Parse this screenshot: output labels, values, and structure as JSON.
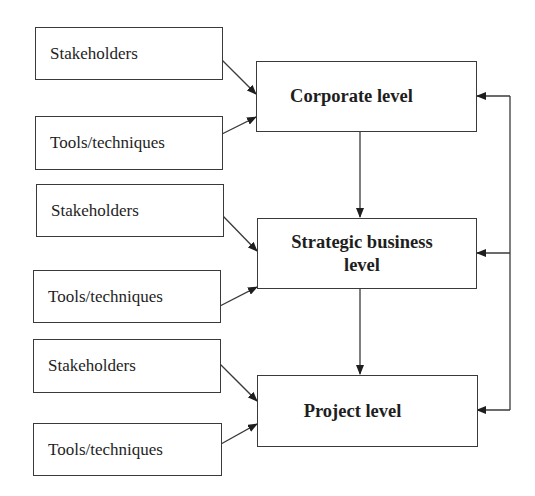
{
  "diagram": {
    "levels": [
      {
        "id": "corporate",
        "label": "Corporate level",
        "inputs": [
          {
            "id": "stakeholders-1",
            "label": "Stakeholders"
          },
          {
            "id": "tools-1",
            "label": "Tools/techniques"
          }
        ]
      },
      {
        "id": "strategic",
        "label": "Strategic business level",
        "inputs": [
          {
            "id": "stakeholders-2",
            "label": "Stakeholders"
          },
          {
            "id": "tools-2",
            "label": "Tools/techniques"
          }
        ]
      },
      {
        "id": "project",
        "label": "Project level",
        "inputs": [
          {
            "id": "stakeholders-3",
            "label": "Stakeholders"
          },
          {
            "id": "tools-3",
            "label": "Tools/techniques"
          }
        ]
      }
    ],
    "edges": [
      {
        "from": "stakeholders-1",
        "to": "corporate"
      },
      {
        "from": "tools-1",
        "to": "corporate"
      },
      {
        "from": "stakeholders-2",
        "to": "strategic"
      },
      {
        "from": "tools-2",
        "to": "strategic"
      },
      {
        "from": "stakeholders-3",
        "to": "project"
      },
      {
        "from": "tools-3",
        "to": "project"
      },
      {
        "from": "corporate",
        "to": "strategic"
      },
      {
        "from": "strategic",
        "to": "project"
      },
      {
        "from": "feedback-loop",
        "to": "corporate"
      },
      {
        "from": "feedback-loop",
        "to": "strategic"
      },
      {
        "from": "feedback-loop",
        "to": "project"
      }
    ],
    "colors": {
      "stroke": "#3a3a3a",
      "text": "#1e1e1e",
      "background": "#ffffff"
    }
  }
}
